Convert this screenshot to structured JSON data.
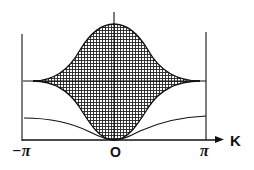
{
  "figure": {
    "type": "dispersion-band-diagram",
    "x_axis_label": "K",
    "tick_labels": {
      "left": "−π",
      "center": "O",
      "right": "π"
    },
    "colors": {
      "ink": "#111111",
      "background": "#ffffff"
    },
    "regions": [
      {
        "name": "continuum-band",
        "fill": "crosshatch",
        "description": "shaded band between upper and lower envelope, pinched at ±π"
      }
    ],
    "curves": [
      {
        "name": "upper-envelope",
        "description": "maximum at K=0, decreasing to band edge at ±π"
      },
      {
        "name": "lower-envelope",
        "description": "zero at K=0, rising to band edge at ±π"
      },
      {
        "name": "lower-branch",
        "description": "acoustic-like branch from 0 at K=0 rising toward ±π"
      },
      {
        "name": "horizontal-level",
        "description": "constant level through band pinch points"
      }
    ]
  }
}
